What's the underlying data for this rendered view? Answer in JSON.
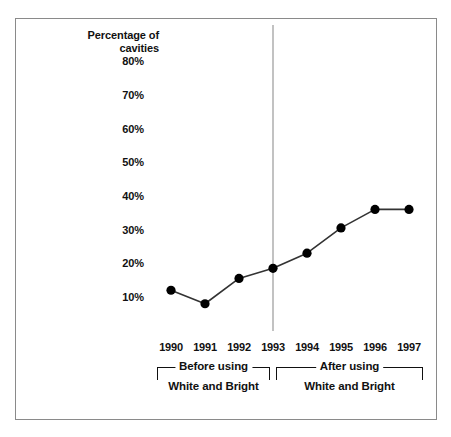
{
  "chart_data": {
    "type": "line",
    "title": "",
    "subtitle": "",
    "xlabel": "",
    "ylabel": "Percentage of cavities",
    "ylabel_lines": [
      "Percentage of",
      "cavities"
    ],
    "categories": [
      "1990",
      "1991",
      "1992",
      "1993",
      "1994",
      "1995",
      "1996",
      "1997"
    ],
    "values": [
      12,
      8,
      15.5,
      18.5,
      23,
      30.5,
      36,
      36
    ],
    "series": [
      {
        "name": "Percentage of cavities",
        "values": [
          12,
          8,
          15.5,
          18.5,
          23,
          30.5,
          36,
          36
        ]
      }
    ],
    "ytick_labels": [
      "80%",
      "70%",
      "60%",
      "50%",
      "40%",
      "30%",
      "20%",
      "10%"
    ],
    "ytick_values": [
      80,
      70,
      60,
      50,
      40,
      30,
      20,
      10
    ],
    "ylim": [
      0,
      85
    ],
    "xlim": [
      "1990",
      "1997"
    ],
    "grid": false,
    "legend": "none",
    "marker": "filled-circle",
    "line_color": "#333333",
    "marker_color": "#000000",
    "divider": {
      "at_category": "1993",
      "color": "#c2c2c2"
    },
    "annotations": [
      {
        "id": "before",
        "label_line1": "Before using",
        "label_line2": "White and Bright",
        "from_category": "1990",
        "to_category": "1993"
      },
      {
        "id": "after",
        "label_line1": "After using",
        "label_line2": "White and Bright",
        "from_category": "1993",
        "to_category": "1997"
      }
    ]
  },
  "figure": {
    "border_color": "#8a8a8a",
    "background": "#ffffff"
  }
}
